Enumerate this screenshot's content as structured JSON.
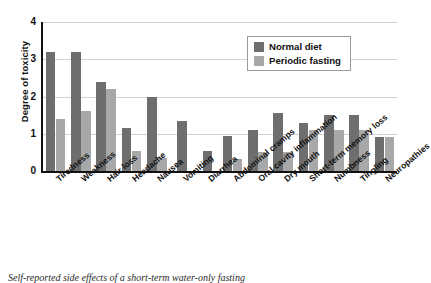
{
  "chart_data": {
    "type": "bar",
    "title": "",
    "xlabel": "",
    "ylabel": "Degree of toxicity",
    "ylim": [
      0,
      4
    ],
    "yticks": [
      0,
      1,
      2,
      3,
      4
    ],
    "grid": true,
    "legend_position": "top-right",
    "categories": [
      "Tiredness",
      "Weakness",
      "Hair loss",
      "Headache",
      "Nausea",
      "Vomiting",
      "Diarrhea",
      "Abdominal cramps",
      "Oral cavity inflammation",
      "Dry mouth",
      "Short-term memory loss",
      "Numbness",
      "Tingling",
      "Neuropathies"
    ],
    "series": [
      {
        "name": "Normal diet",
        "color": "#6e6e6e",
        "values": [
          3.2,
          3.2,
          2.4,
          1.15,
          2.0,
          1.35,
          0.55,
          0.95,
          1.1,
          1.55,
          1.3,
          1.5,
          1.5,
          0.9
        ]
      },
      {
        "name": "Periodic fasting",
        "color": "#a8a8a8",
        "values": [
          1.4,
          1.6,
          2.2,
          0.55,
          0.35,
          0,
          0,
          0.33,
          0.5,
          0.5,
          1.1,
          1.1,
          1.1,
          0.9
        ]
      }
    ]
  },
  "legend": {
    "entries": [
      {
        "label": "Normal diet"
      },
      {
        "label": "Periodic fasting"
      }
    ]
  },
  "caption": {
    "text": "Self-reported side effects of a short-term water-only fasting"
  }
}
